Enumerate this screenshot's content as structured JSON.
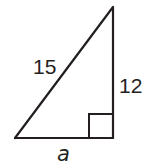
{
  "diagram": {
    "type": "right-triangle",
    "stroke_color": "#231f20",
    "background": "#ffffff",
    "sides": {
      "hypotenuse": {
        "label": "15"
      },
      "vertical_leg": {
        "label": "12"
      },
      "horizontal_leg": {
        "label": "a"
      }
    },
    "right_angle_marker": "bottom-right"
  }
}
